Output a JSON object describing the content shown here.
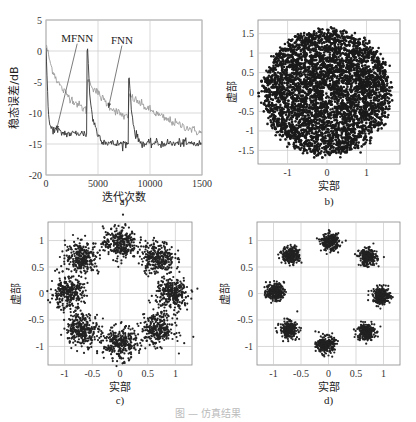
{
  "figure_caption": "图 — 仿真结果",
  "chart_data": [
    {
      "id": "a",
      "type": "line",
      "subcaption": "a)",
      "title": "",
      "xlabel": "迭代次数",
      "ylabel": "稳态误差/dB",
      "xlim": [
        0,
        15000
      ],
      "ylim": [
        -20,
        5
      ],
      "xticks": [
        0,
        5000,
        10000,
        15000
      ],
      "xtick_labels": [
        "0",
        "5000",
        "10000",
        "1500"
      ],
      "yticks": [
        5,
        0,
        -5,
        -10,
        -15,
        -20
      ],
      "grid": true,
      "annotations": [
        {
          "text": "MFNN",
          "x_text": 3000,
          "y_text": 1.5,
          "arrow_to": [
            1000,
            -12.8
          ]
        },
        {
          "text": "FNN",
          "x_text": 7300,
          "y_text": 1.2,
          "arrow_to": [
            6000,
            -9.2
          ]
        }
      ],
      "series": [
        {
          "name": "FNN",
          "color": "#9a9a9a",
          "x": [
            0,
            500,
            1000,
            1500,
            2000,
            2500,
            3000,
            3500,
            3900,
            4000,
            4500,
            5000,
            5500,
            6000,
            6500,
            7000,
            7500,
            7900,
            8000,
            8500,
            9000,
            9500,
            10000,
            10500,
            11000,
            11500,
            12000,
            12500,
            13000,
            13500,
            14000,
            14500,
            15000
          ],
          "y": [
            1,
            -2.5,
            -4.5,
            -6,
            -7,
            -7.8,
            -8.5,
            -9.2,
            -9.6,
            -4.5,
            -5.8,
            -6.8,
            -7.8,
            -8.7,
            -9.4,
            -10,
            -10.5,
            -10.8,
            -7.2,
            -7.8,
            -8.4,
            -9,
            -9.5,
            -10,
            -10.5,
            -11,
            -11.3,
            -11.7,
            -12,
            -12.3,
            -12.6,
            -13,
            -13.2
          ]
        },
        {
          "name": "MFNN",
          "color": "#333333",
          "x": [
            0,
            100,
            200,
            300,
            500,
            1000,
            1500,
            2000,
            2500,
            3000,
            3500,
            3900,
            3950,
            4000,
            4200,
            4500,
            5000,
            5500,
            6000,
            6500,
            7000,
            7500,
            7900,
            7950,
            8000,
            8200,
            8500,
            9000,
            9500,
            10000,
            10500,
            11000,
            11500,
            12000,
            12500,
            13000,
            13500,
            14000,
            14500,
            15000
          ],
          "y": [
            0.5,
            -4,
            -9,
            -11.5,
            -12.5,
            -12.8,
            -13.2,
            -13.3,
            -13.4,
            -13.2,
            -13.3,
            -13.4,
            0,
            0.3,
            -7,
            -11,
            -13.5,
            -14.5,
            -14.8,
            -15,
            -15,
            -14.9,
            -15,
            -4.5,
            -4.3,
            -9,
            -13,
            -14.6,
            -15,
            -15,
            -14.8,
            -15,
            -14.8,
            -14.9,
            -15,
            -14.7,
            -15,
            -14.9,
            -15,
            -15.1
          ]
        }
      ]
    },
    {
      "id": "b",
      "type": "scatter",
      "subcaption": "b)",
      "xlabel": "实部",
      "ylabel": "虚部",
      "xlim": [
        -1.75,
        1.85
      ],
      "ylim": [
        -1.85,
        1.85
      ],
      "xticks": [
        -1,
        0,
        1
      ],
      "yticks": [
        1.5,
        1,
        0.5,
        0,
        -0.5,
        -1,
        -1.5
      ],
      "ytick_labels": [
        "1.5",
        "1",
        "0.5",
        "0",
        "-0.5",
        "-1",
        "-1.5"
      ],
      "grid": true,
      "description": "Dense filled disk of points, radius ~1.6, centred at origin, small hollow near 0",
      "clusters": [
        {
          "cx": 0,
          "cy": 0,
          "radius": 1.6,
          "spread": "uniform disk"
        }
      ]
    },
    {
      "id": "c",
      "type": "scatter",
      "subcaption": "c)",
      "xlabel": "实部",
      "ylabel": "虚部",
      "xlim": [
        -1.3,
        1.3
      ],
      "ylim": [
        -1.35,
        1.35
      ],
      "xticks": [
        -1,
        -0.5,
        0,
        0.5,
        1
      ],
      "yticks": [
        1,
        0.5,
        0,
        -0.5,
        -1
      ],
      "grid": true,
      "description": "8-PSK constellation, 8 loose clusters on unit circle",
      "clusters": [
        {
          "cx": 0,
          "cy": 0.95,
          "spread": 0.15
        },
        {
          "cx": 0.68,
          "cy": 0.68,
          "spread": 0.15
        },
        {
          "cx": 0.95,
          "cy": 0,
          "spread": 0.15
        },
        {
          "cx": 0.68,
          "cy": -0.68,
          "spread": 0.15
        },
        {
          "cx": 0,
          "cy": -0.95,
          "spread": 0.15
        },
        {
          "cx": -0.68,
          "cy": -0.68,
          "spread": 0.15
        },
        {
          "cx": -0.95,
          "cy": 0,
          "spread": 0.15
        },
        {
          "cx": -0.68,
          "cy": 0.68,
          "spread": 0.15
        }
      ]
    },
    {
      "id": "d",
      "type": "scatter",
      "subcaption": "d)",
      "xlabel": "实部",
      "ylabel": "虚部",
      "xlim": [
        -1.3,
        1.3
      ],
      "ylim": [
        -1.35,
        1.35
      ],
      "xticks": [
        -1,
        -0.5,
        0,
        0.5,
        1
      ],
      "yticks": [
        1,
        0.5,
        0,
        -0.5,
        -1
      ],
      "grid": true,
      "description": "8-PSK constellation, 8 tight clusters on unit circle",
      "clusters": [
        {
          "cx": 0.03,
          "cy": 0.97,
          "spread": 0.08
        },
        {
          "cx": 0.72,
          "cy": 0.68,
          "spread": 0.08
        },
        {
          "cx": 0.97,
          "cy": -0.05,
          "spread": 0.08
        },
        {
          "cx": 0.68,
          "cy": -0.72,
          "spread": 0.08
        },
        {
          "cx": -0.05,
          "cy": -0.97,
          "spread": 0.08
        },
        {
          "cx": -0.72,
          "cy": -0.68,
          "spread": 0.08
        },
        {
          "cx": -0.97,
          "cy": 0.03,
          "spread": 0.08
        },
        {
          "cx": -0.68,
          "cy": 0.72,
          "spread": 0.08
        }
      ]
    }
  ]
}
